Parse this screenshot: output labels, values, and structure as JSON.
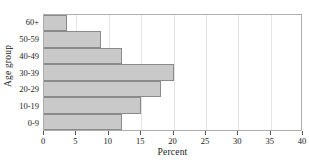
{
  "chart_data": {
    "type": "bar",
    "orientation": "horizontal",
    "title": "",
    "xlabel": "Percent",
    "ylabel": "Age group",
    "categories": [
      "60+",
      "50-59",
      "40-49",
      "30-39",
      "20-29",
      "10-19",
      "0-9"
    ],
    "values": [
      3.6,
      8.8,
      12.0,
      20.0,
      18.0,
      15.0,
      12.0
    ],
    "xlim": [
      0,
      40
    ],
    "xticks": [
      0,
      5,
      10,
      15,
      20,
      25,
      30,
      35,
      40
    ],
    "xtick_labels": [
      "0",
      "5",
      "10",
      "15",
      "20",
      "25",
      "30",
      "35",
      "40"
    ],
    "grid": "vertical-light",
    "legend": "none",
    "bar_color": "#c9c9c9",
    "bar_border_color": "#8a8a8a",
    "grid_color": "#e4e4e4",
    "frame_color": "#adadad"
  }
}
